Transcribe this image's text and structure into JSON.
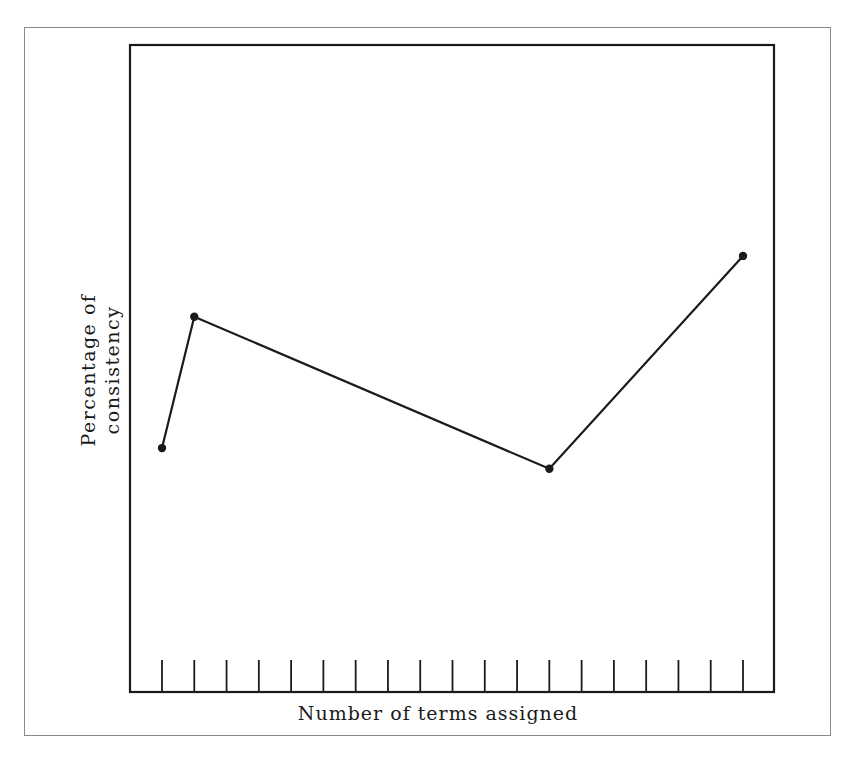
{
  "chart_data": {
    "type": "line",
    "title": "",
    "xlabel": "Number of terms assigned",
    "ylabel": [
      "Percentage of",
      "consistency"
    ],
    "x_ticks_count": 19,
    "x_tick_labels": [],
    "y_tick_labels": [],
    "grid": false,
    "legend": null,
    "note": "No numeric axis labels shown; y values are relative positions on a 0-100 scale of plot height, x values are tick indices (0-18).",
    "series": [
      {
        "name": "consistency",
        "x": [
          0,
          1,
          12,
          18
        ],
        "values": [
          37.7,
          58.0,
          34.5,
          67.4
        ],
        "marker": "dot",
        "color": "#1a1a1a"
      }
    ],
    "ylim": [
      0,
      100
    ],
    "xlim": [
      -1,
      19
    ]
  },
  "colors": {
    "line": "#1a1a1a",
    "axis": "#1a1a1a",
    "outer_frame": "#8a8a8a",
    "background": "#ffffff"
  }
}
